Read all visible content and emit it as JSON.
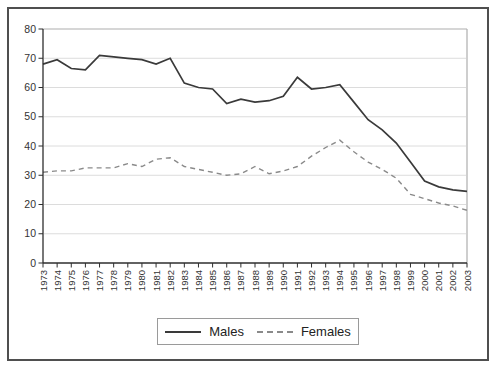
{
  "figure": {
    "background": "#ffffff",
    "border_color": "#4f4f4f"
  },
  "legend": {
    "items": [
      {
        "label": "Males",
        "style": "solid",
        "color": "#3a3a3a"
      },
      {
        "label": "Females",
        "style": "dashed",
        "color": "#8a8a8a"
      }
    ]
  },
  "chart_data": {
    "type": "line",
    "title": "",
    "xlabel": "",
    "ylabel": "",
    "x": [
      1973,
      1974,
      1975,
      1976,
      1977,
      1978,
      1979,
      1980,
      1981,
      1982,
      1983,
      1984,
      1985,
      1986,
      1987,
      1988,
      1989,
      1990,
      1991,
      1992,
      1993,
      1994,
      1995,
      1996,
      1997,
      1998,
      1999,
      2000,
      2001,
      2002,
      2003
    ],
    "series": [
      {
        "name": "Males",
        "style": "solid",
        "color": "#3a3a3a",
        "values": [
          68,
          69.5,
          66.5,
          66,
          71,
          70.5,
          70,
          69.5,
          68,
          70,
          61.5,
          60,
          59.5,
          54.5,
          56,
          55,
          55.5,
          57,
          63.5,
          59.5,
          60,
          61,
          55,
          49,
          45.5,
          41,
          34.5,
          28,
          26,
          25,
          24.5
        ]
      },
      {
        "name": "Females",
        "style": "dashed",
        "color": "#8a8a8a",
        "values": [
          31,
          31.5,
          31.5,
          32.5,
          32.5,
          32.5,
          34,
          33,
          35.5,
          36,
          33,
          32,
          31,
          30,
          30.5,
          33,
          30.5,
          31.5,
          33,
          36.5,
          39.5,
          42,
          38,
          34.5,
          32,
          29,
          23.5,
          22,
          20.5,
          19.5,
          18
        ]
      }
    ],
    "ylim": [
      0,
      80
    ],
    "yticks": [
      0,
      10,
      20,
      30,
      40,
      50,
      60,
      70,
      80
    ],
    "grid": true,
    "grid_color": "#dcdcdc",
    "axis_color": "#2e2e2e",
    "plot_border_color": "#aeaeae",
    "tick_label_color": "#333333",
    "legend_position": "bottom-center"
  }
}
